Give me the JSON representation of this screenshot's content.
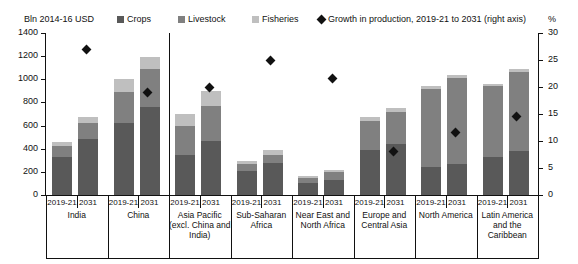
{
  "legend": {
    "unit_label": "Bln 2014-16 USD",
    "items": [
      {
        "label": "Crops",
        "color": "#595959",
        "type": "swatch"
      },
      {
        "label": "Livestock",
        "color": "#808080",
        "type": "swatch"
      },
      {
        "label": "Fisheries",
        "color": "#bfbfbf",
        "type": "swatch"
      },
      {
        "label": "Growth in production, 2019-21 to 2031 (right axis)",
        "color": "#111111",
        "type": "diamond"
      }
    ],
    "right_axis_unit": "%"
  },
  "axes": {
    "left_ticks": [
      "1400",
      "1200",
      "1000",
      "800",
      "600",
      "400",
      "200",
      "0"
    ],
    "right_ticks": [
      "30",
      "25",
      "20",
      "15",
      "10",
      "5",
      "0"
    ],
    "left_title": "Bln 2014-16 USD",
    "right_title": "%"
  },
  "chart_data": {
    "type": "bar",
    "title": "",
    "subtitle": "",
    "xlabel": "",
    "ylabel": "Bln 2014-16 USD",
    "ylabel_right": "%",
    "ylim": [
      0,
      1400
    ],
    "ylim_right": [
      0,
      30
    ],
    "grid": false,
    "legend_position": "top",
    "stacked": true,
    "categories": [
      "India",
      "China",
      "Asia Pacific (excl. China and India)",
      "Sub-Saharan Africa",
      "Near East and North Africa",
      "Europe and Central Asia",
      "North America",
      "Latin America and the Caribbean"
    ],
    "periods": [
      "2019-21",
      "2031"
    ],
    "series": [
      {
        "name": "Crops",
        "color": "#595959",
        "values_2019_21": [
          330,
          620,
          350,
          210,
          100,
          390,
          240,
          330
        ],
        "values_2031": [
          480,
          760,
          470,
          280,
          130,
          440,
          270,
          380
        ]
      },
      {
        "name": "Livestock",
        "color": "#808080",
        "values_2019_21": [
          90,
          270,
          250,
          55,
          50,
          250,
          680,
          610
        ],
        "values_2031": [
          140,
          330,
          300,
          70,
          65,
          280,
          740,
          680
        ]
      },
      {
        "name": "Fisheries",
        "color": "#bfbfbf",
        "values_2019_21": [
          40,
          110,
          100,
          25,
          15,
          30,
          25,
          20
        ],
        "values_2031": [
          55,
          100,
          125,
          35,
          25,
          35,
          30,
          30
        ]
      }
    ],
    "totals_2019_21": [
      460,
      1000,
      700,
      290,
      165,
      670,
      945,
      960
    ],
    "totals_2031": [
      675,
      1190,
      895,
      385,
      220,
      755,
      1040,
      1090
    ],
    "growth_series": {
      "name": "Growth in production, 2019-21 to 2031 (right axis)",
      "marker": "diamond",
      "color": "#111111",
      "axis": "right",
      "unit": "%",
      "values": [
        27.0,
        19.0,
        20.0,
        25.0,
        21.5,
        8.0,
        11.5,
        14.5
      ]
    }
  }
}
